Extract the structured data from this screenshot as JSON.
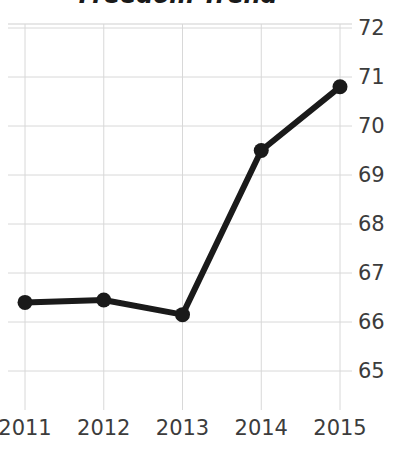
{
  "chart_data": {
    "type": "line",
    "title": "Freedom Trend",
    "xlabel": "",
    "ylabel": "",
    "categories": [
      "2011",
      "2012",
      "2013",
      "2014",
      "2015"
    ],
    "x": [
      2011,
      2012,
      2013,
      2014,
      2015
    ],
    "values": [
      66.4,
      66.45,
      66.15,
      69.5,
      70.8
    ],
    "series": [
      {
        "name": "Freedom score",
        "values": [
          66.4,
          66.45,
          66.15,
          69.5,
          70.8
        ]
      }
    ],
    "ylim": [
      64.6,
      72.4
    ],
    "xlim": [
      2010.75,
      2015.25
    ],
    "y_ticks": [
      72,
      71,
      70,
      69,
      68,
      67,
      66,
      65
    ],
    "y_tick_labels": [
      "72",
      "71",
      "70",
      "69",
      "68",
      "67",
      "66",
      "65"
    ],
    "x_ticks": [
      2011,
      2012,
      2013,
      2014,
      2015
    ],
    "x_tick_labels": [
      "2011",
      "2012",
      "2013",
      "2014",
      "2015"
    ],
    "grid": true,
    "grid_axis": "both",
    "legend": false,
    "legend_position": "none",
    "y_axis_side": "right",
    "marker": "circle",
    "line_color": "#1a1a1a",
    "marker_color": "#1a1a1a",
    "grid_color": "#d8d8d8",
    "title_color": "#1a1a1a",
    "tick_label_color": "#3c3c3c",
    "background_color": "#ffffff"
  }
}
